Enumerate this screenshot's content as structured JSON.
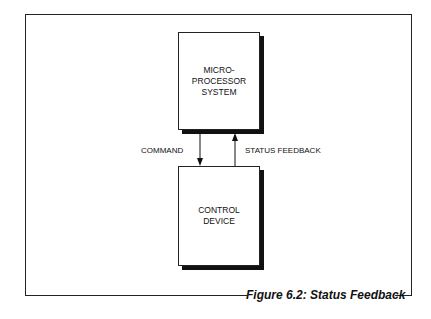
{
  "diagram": {
    "top_box": {
      "label": "MICRO-\nPROCESSOR\nSYSTEM"
    },
    "bottom_box": {
      "label": "CONTROL\nDEVICE"
    },
    "arrows": [
      {
        "label": "COMMAND",
        "direction": "down",
        "from": "top_box",
        "to": "bottom_box"
      },
      {
        "label": "STATUS FEEDBACK",
        "direction": "up",
        "from": "bottom_box",
        "to": "top_box"
      }
    ],
    "caption": "Figure 6.2: Status Feedback"
  }
}
